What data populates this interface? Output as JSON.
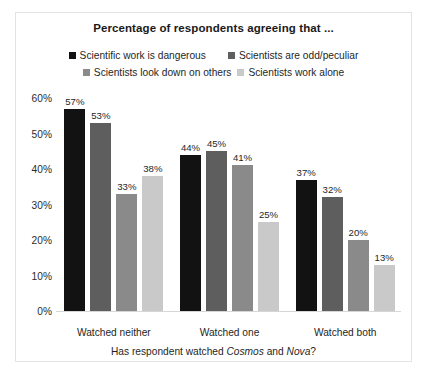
{
  "chart_data": {
    "type": "bar",
    "title": "Percentage of respondents agreeing that ...",
    "xlabel_parts": {
      "before": "Has respondent watched ",
      "italic1": "Cosmos",
      "middle": " and ",
      "italic2": "Nova",
      "after": "?"
    },
    "ylabel": "",
    "categories": [
      "Watched neither",
      "Watched one",
      "Watched both"
    ],
    "ylim": [
      0,
      60
    ],
    "ytick_labels": [
      "60%",
      "50%",
      "40%",
      "30%",
      "20%",
      "10%",
      "0%"
    ],
    "ytick_values": [
      60,
      50,
      40,
      30,
      20,
      10,
      0
    ],
    "grid": false,
    "legend_position": "top",
    "series": [
      {
        "name": "Scientific work is dangerous",
        "color": "#121212",
        "values": [
          57,
          44,
          37
        ],
        "labels": [
          "57%",
          "44%",
          "37%"
        ]
      },
      {
        "name": "Scientists are odd/peculiar",
        "color": "#5e5e5e",
        "values": [
          53,
          45,
          32
        ],
        "labels": [
          "53%",
          "45%",
          "32%"
        ]
      },
      {
        "name": "Scientists look down on others",
        "color": "#8a8a8a",
        "values": [
          33,
          41,
          20
        ],
        "labels": [
          "33%",
          "41%",
          "20%"
        ]
      },
      {
        "name": "Scientists work alone",
        "color": "#c9c9c9",
        "values": [
          38,
          25,
          13
        ],
        "labels": [
          "38%",
          "25%",
          "13%"
        ]
      }
    ]
  }
}
